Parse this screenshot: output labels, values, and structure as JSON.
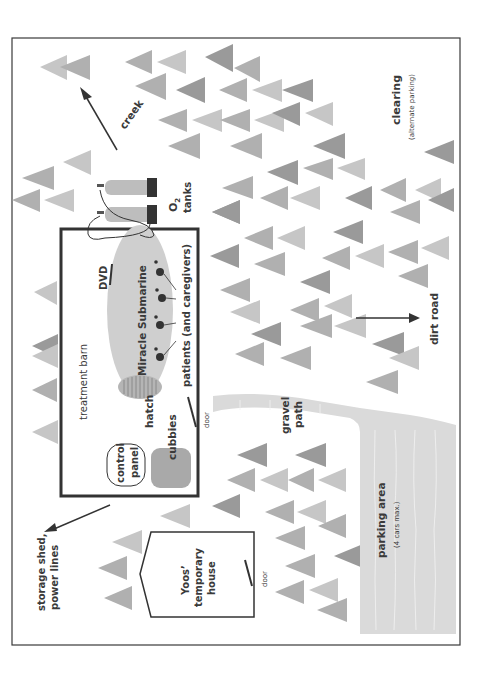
{
  "map": {
    "title": "Property map",
    "labels": {
      "treatment_barn": "treatment barn",
      "dvd": "DVD",
      "miracle_submarine": "Miracle Submarine",
      "patients": "patients (and caregivers)",
      "hatch": "hatch",
      "control_panel_line1": "control",
      "control_panel_line2": "panel",
      "cubbies": "cubbies",
      "barn_door": "door",
      "o2_tanks_line1": "O",
      "o2_tanks_sub": "2",
      "o2_tanks_line2": "tanks",
      "creek": "creek",
      "clearing": "clearing",
      "clearing_note": "(alternate parking)",
      "dirt_road": "dirt road",
      "gravel_path_line1": "gravel",
      "gravel_path_line2": "path",
      "parking_area": "parking area",
      "parking_note": "(4 cars max.)",
      "house_line1": "Yoos’",
      "house_line2": "temporary",
      "house_line3": "house",
      "house_door": "door",
      "storage_line1": "storage shed,",
      "storage_line2": "power lines"
    },
    "colors": {
      "border": "#3a3a3a",
      "tree_dark": "#9a9a9a",
      "tree_mid": "#b0b0b0",
      "tree_light": "#c6c6c6",
      "submarine": "#cfcfcf",
      "gravel": "#dadada",
      "cubbies": "#a9a9a9",
      "tank": "#bdbdbd",
      "tank_cap": "#333333"
    }
  }
}
